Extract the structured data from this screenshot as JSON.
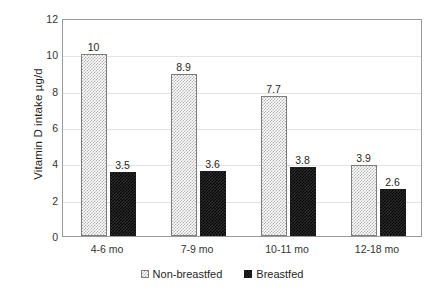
{
  "chart_data": {
    "type": "bar",
    "title": "",
    "xlabel": "",
    "ylabel": "Vitamin D intake  µg/d",
    "categories": [
      "4-6 mo",
      "7-9 mo",
      "10-11 mo",
      "12-18 mo"
    ],
    "series": [
      {
        "name": "Non-breastfed",
        "values": [
          10,
          8.9,
          7.7,
          3.9
        ],
        "labels": [
          "10",
          "8.9",
          "7.7",
          "3.9"
        ],
        "swatch": "checker-light"
      },
      {
        "name": "Breastfed",
        "values": [
          3.5,
          3.6,
          3.8,
          2.6
        ],
        "labels": [
          "3.5",
          "3.6",
          "3.8",
          "2.6"
        ],
        "swatch": "checker-dark"
      }
    ],
    "ylim": [
      0,
      12
    ],
    "yticks": [
      0,
      2,
      4,
      6,
      8,
      10,
      12
    ],
    "ytick_labels": [
      "0",
      "2",
      "4",
      "6",
      "8",
      "10",
      "12"
    ],
    "grid": "horizontal",
    "legend_position": "bottom-center",
    "colors": {
      "non_breastfed_fill": "#b4b4b4",
      "non_breastfed_edge": "#7d7d7d",
      "breastfed_fill": "#2a2a2a",
      "breastfed_edge": "#1c1c1c",
      "gridline": "#e3e3e3",
      "frame": "#9a9a9a",
      "text": "#262626",
      "background": "#ffffff"
    }
  }
}
